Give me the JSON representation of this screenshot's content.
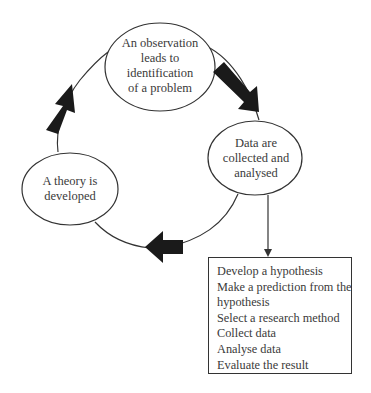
{
  "diagram": {
    "type": "cycle",
    "nodes": [
      {
        "id": "observation",
        "lines": [
          "An observation",
          "leads to",
          "identification",
          "of a problem"
        ]
      },
      {
        "id": "data",
        "lines": [
          "Data are",
          "collected and",
          "analysed"
        ]
      },
      {
        "id": "theory",
        "lines": [
          "A theory is",
          "developed"
        ]
      }
    ],
    "cycle_order": [
      "observation",
      "data",
      "theory",
      "observation"
    ],
    "steps_box": {
      "items": [
        "Develop a hypothesis",
        "Make a prediction from the",
        "hypothesis",
        "Select a research method",
        "Collect data",
        "Analyse data",
        "Evaluate the result"
      ]
    },
    "colors": {
      "stroke": "#333333",
      "arrow_fill": "#1a1a1a",
      "text": "#3a3a3a"
    }
  }
}
